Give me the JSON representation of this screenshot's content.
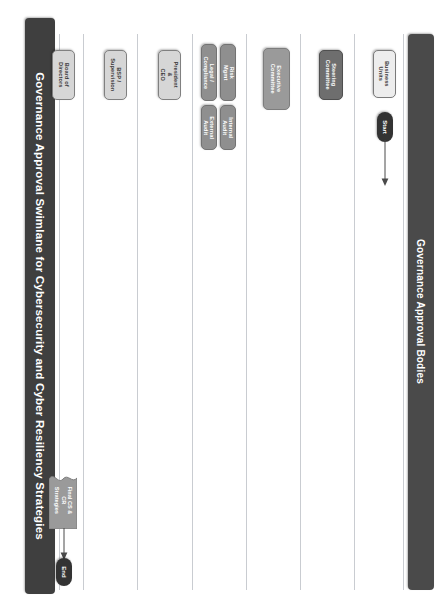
{
  "diagram": {
    "title": "Governance Approval Swimlane for Cybersecurity and Cyber Resiliency Strategies",
    "lane_group_header": "Governance Approval Bodies",
    "title_bar_color": "#3f3f3f",
    "lane_header_color": "#4a4a4a",
    "lane_divider_color": "#c9ccd1",
    "canvas_background": "#ffffff"
  },
  "lanes": [
    {
      "id": "business-units",
      "label": "Business\nUnits",
      "fill": "#ededed",
      "stroke": "#7a7a7a",
      "text_color": "#3a3a3a"
    },
    {
      "id": "steering-committee",
      "label": "Steering\nCommittee",
      "fill": "#6e6e6e",
      "stroke": "#4f4f4f",
      "text_color": "#ffffff"
    },
    {
      "id": "executive-committee",
      "label": "Executive\nCommittee",
      "fill": "#9a9a9a",
      "stroke": "#7d7d7d",
      "text_color": "#ffffff"
    },
    {
      "id": "assurance-lane",
      "label": "",
      "fill": "#9a9a9a",
      "stroke": "#7d7d7d",
      "text_color": "#ffffff"
    },
    {
      "id": "president-ceo",
      "label": "President &\nCEO",
      "fill": "#d6d6d6",
      "stroke": "#808080",
      "text_color": "#3a3a3a"
    },
    {
      "id": "bsp-supervision",
      "label": "BSP /\nSupervision",
      "fill": "#d6d6d6",
      "stroke": "#808080",
      "text_color": "#3a3a3a"
    },
    {
      "id": "board-of-directors",
      "label": "Board of\nDirectors",
      "fill": "#d6d6d6",
      "stroke": "#808080",
      "text_color": "#3a3a3a"
    }
  ],
  "assurance_nodes": [
    {
      "id": "risk-mgmt",
      "label": "Risk Mgmt",
      "fill": "#8f8f8f",
      "stroke": "#737373",
      "text_color": "#ffffff"
    },
    {
      "id": "legal-compliance",
      "label": "Legal /\nCompliance",
      "fill": "#8f8f8f",
      "stroke": "#737373",
      "text_color": "#ffffff"
    },
    {
      "id": "internal-audit",
      "label": "Internal\nAudit",
      "fill": "#8f8f8f",
      "stroke": "#737373",
      "text_color": "#ffffff"
    },
    {
      "id": "external-audit",
      "label": "External\nAudit",
      "fill": "#8f8f8f",
      "stroke": "#737373",
      "text_color": "#ffffff"
    }
  ],
  "terminators": {
    "start": {
      "label": "Start",
      "fill": "#333333",
      "text_color": "#ffffff"
    },
    "end": {
      "label": "End",
      "fill": "#333333",
      "text_color": "#ffffff"
    }
  },
  "artifacts": [
    {
      "id": "final-strategies",
      "label": "Final CS &\nCR\nStrategies",
      "fill": "#9a9a9a",
      "stroke": "#7d7d7d",
      "text_color": "#ffffff"
    }
  ]
}
